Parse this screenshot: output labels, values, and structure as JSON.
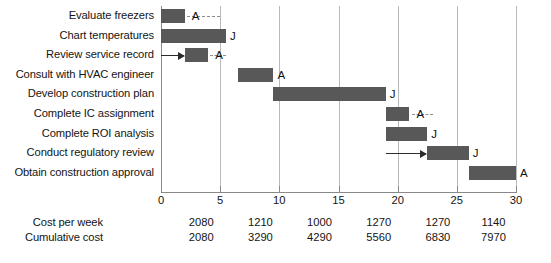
{
  "chart_data": {
    "type": "bar",
    "subtype": "gantt",
    "title": "",
    "xlabel": "",
    "ylabel": "",
    "xlim": [
      0,
      30
    ],
    "xticks": [
      0,
      5,
      10,
      15,
      20,
      25,
      30
    ],
    "xtick_labels": [
      "0",
      "5",
      "10",
      "15",
      "20",
      "25",
      "30"
    ],
    "grid": true,
    "grid_axis": "x",
    "legend": null,
    "bar_color": "#585858",
    "slack_color": "#8d8d8d",
    "categories": [
      "Evaluate freezers",
      "Chart temperatures",
      "Review service record",
      "Consult with HVAC engineer",
      "Develop construction plan",
      "Complete IC assignment",
      "Complete ROI analysis",
      "Conduct regulatory review",
      "Obtain construction approval"
    ],
    "tasks": [
      {
        "label": "Evaluate freezers",
        "start": 0.0,
        "end": 2.0,
        "slack_end": 5.0,
        "slack_marker": "A",
        "end_marker": ""
      },
      {
        "label": "Chart temperatures",
        "start": 0.0,
        "end": 5.5,
        "slack_end": null,
        "slack_marker": "",
        "end_marker": "J"
      },
      {
        "label": "Review service record",
        "start": 2.0,
        "end": 4.0,
        "slack_end": 5.5,
        "slack_marker": "A",
        "end_marker": "",
        "arrow_from": 0.0
      },
      {
        "label": "Consult with HVAC engineer",
        "start": 6.5,
        "end": 9.5,
        "slack_end": null,
        "slack_marker": "",
        "end_marker": "A"
      },
      {
        "label": "Develop construction plan",
        "start": 9.5,
        "end": 19.0,
        "slack_end": null,
        "slack_marker": "",
        "end_marker": "J"
      },
      {
        "label": "Complete IC assignment",
        "start": 19.0,
        "end": 21.0,
        "slack_end": 23.0,
        "slack_marker": "A",
        "end_marker": ""
      },
      {
        "label": "Complete ROI analysis",
        "start": 19.0,
        "end": 22.5,
        "slack_end": null,
        "slack_marker": "",
        "end_marker": "J"
      },
      {
        "label": "Conduct regulatory review",
        "start": 22.5,
        "end": 26.0,
        "slack_end": null,
        "slack_marker": "",
        "end_marker": "J",
        "arrow_from": 19.0
      },
      {
        "label": "Obtain construction approval",
        "start": 26.0,
        "end": 30.0,
        "slack_end": null,
        "slack_marker": "",
        "end_marker": "A"
      }
    ],
    "cost_table": {
      "rows": [
        {
          "label": "Cost per week",
          "values": [
            "2080",
            "1210",
            "1000",
            "1270",
            "1270",
            "1140"
          ]
        },
        {
          "label": "Cumulative cost",
          "values": [
            "2080",
            "3290",
            "4290",
            "5560",
            "6830",
            "7970"
          ]
        }
      ],
      "column_positions": [
        3.4,
        8.4,
        13.4,
        18.4,
        23.4,
        28.1
      ]
    }
  }
}
